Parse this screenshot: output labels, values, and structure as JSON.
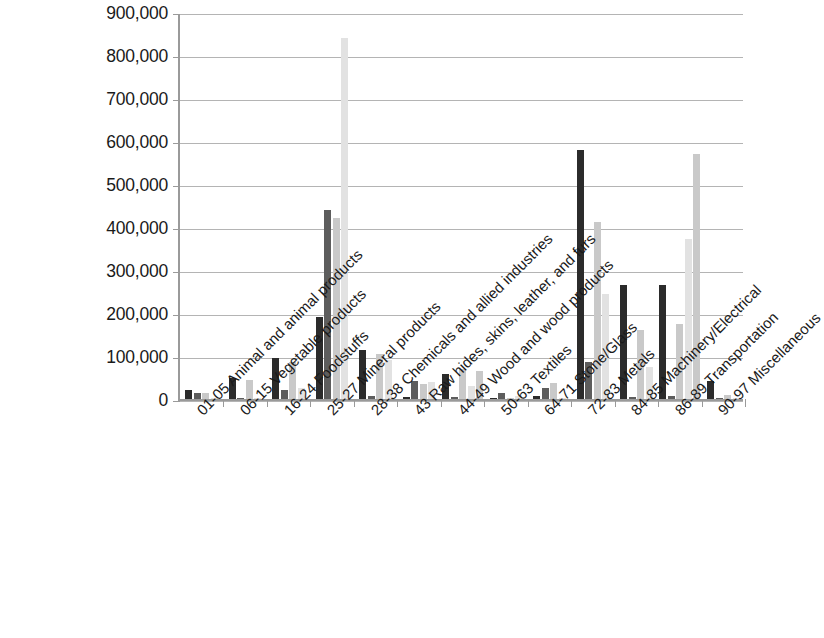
{
  "chart_data": {
    "type": "bar",
    "title": "",
    "subtitle": "",
    "xlabel": "",
    "ylabel": "",
    "ylim": [
      0,
      900000
    ],
    "ytick_labels": [
      "900,000",
      "800,000",
      "700,000",
      "600,000",
      "500,000",
      "400,000",
      "300,000",
      "200,000",
      "100,000",
      "0"
    ],
    "ytick_values": [
      900000,
      800000,
      700000,
      600000,
      500000,
      400000,
      300000,
      200000,
      100000,
      0
    ],
    "grid": true,
    "legend": "none",
    "orientation": "vertical",
    "bar_group_mode": "clustered",
    "categories": [
      "01-05 Animal and animal products",
      "06-15 Vegetable products",
      "16-24 Foodstuffs",
      "25-27 Mineral products",
      "28-38 Chemicals and allied industries",
      "43 Raw hides, skins, leather, and furs",
      "44-49 Wood and wood products",
      "50-63 Textiles",
      "64-71 Stone/Glass",
      "72-83 Metals",
      "84-85 Machinery/Electrical",
      "86-89 Transportation",
      "90-97 Miscellaneous"
    ],
    "series": [
      {
        "name": "Series 1",
        "color": "#2b2b2b",
        "values": [
          22000,
          48000,
          95000,
          190000,
          115000,
          4000,
          58000,
          3000,
          6000,
          580000,
          265000,
          265000,
          42000
        ]
      },
      {
        "name": "Series 2",
        "color": "#5d5d5d",
        "values": [
          15000,
          2000,
          20000,
          440000,
          8000,
          42000,
          5000,
          14000,
          25000,
          85000,
          5000,
          8000,
          3000
        ]
      },
      {
        "name": "Series 3",
        "color": "#c9c9c9",
        "values": [
          13000,
          45000,
          85000,
          420000,
          105000,
          35000,
          70000,
          3000,
          38000,
          412000,
          160000,
          175000,
          9000
        ]
      },
      {
        "name": "Series 4",
        "color": "#e2e2e2",
        "values": [
          3000,
          3000,
          25000,
          840000,
          90000,
          40000,
          30000,
          8000,
          3000,
          245000,
          75000,
          372000,
          3000
        ]
      },
      {
        "name": "Series 5",
        "color": "#c9c9c9",
        "values": [
          0,
          0,
          0,
          0,
          0,
          0,
          65000,
          0,
          0,
          0,
          0,
          570000,
          0
        ]
      }
    ]
  },
  "colors": {
    "series_1": "#2b2b2b",
    "series_2": "#5d5d5d",
    "series_3": "#c9c9c9",
    "series_4": "#e2e2e2",
    "axis": "#9a9a9a",
    "gridline": "#b4b4b4",
    "text": "#1a1a1a",
    "background": "#ffffff"
  }
}
